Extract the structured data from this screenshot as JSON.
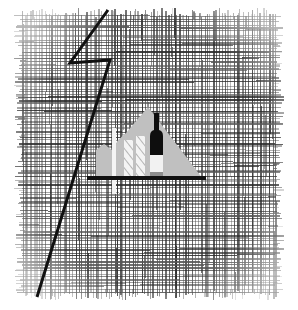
{
  "artwork": {
    "title": "Crosshatched Square with Mountain, Candles, Bottle and Lightning Bolt",
    "medium": "pen-and-ink line drawing",
    "canvas": {
      "width": 298,
      "height": 310,
      "background_color": "#ffffff"
    },
    "palette": {
      "ink": "#111111",
      "hatch_dark": "#2b2b2b",
      "hatch_mid": "#555555",
      "silhouette_gray": "#c0c0c0",
      "highlight_white": "#f4f4f4",
      "bottle_dark": "#0e0e0e",
      "bottle_light": "#f2f2f2",
      "background": "#ffffff"
    },
    "elements": [
      {
        "name": "crosshatch-field",
        "label": "Crosshatched square background",
        "shape": "square",
        "x": 22,
        "y": 16,
        "width": 254,
        "height": 276,
        "edge": "frayed",
        "vertical_strokes": 86,
        "horizontal_strokes": 92,
        "color": "#2b2b2b"
      },
      {
        "name": "mountain-silhouette",
        "label": "Gray mountain / house silhouette",
        "shape": "polygon",
        "apex": [
          148,
          107
        ],
        "base_y": 179,
        "left_edge_x": 96,
        "right_edge_x": 203,
        "fill": "#c0c0c0",
        "has_left_shoulder_notch": true
      },
      {
        "name": "ground-bar",
        "label": "Horizontal black ground bar",
        "shape": "rect",
        "x": 87,
        "y": 176,
        "width": 119,
        "height": 4,
        "fill": "#111111"
      },
      {
        "name": "light-pole",
        "label": "Tall thin light vertical bar",
        "shape": "rect",
        "x": 112,
        "y": 128,
        "width": 4,
        "height": 66,
        "fill": "#f4f4f4"
      },
      {
        "name": "candle-left",
        "label": "Left hatched candle bar",
        "shape": "rect",
        "x": 124,
        "y": 140,
        "width": 9,
        "height": 38,
        "fill": "#f4f4f4",
        "hatching": "diagonal"
      },
      {
        "name": "candle-right",
        "label": "Right hatched candle bar",
        "shape": "rect",
        "x": 136,
        "y": 136,
        "width": 9,
        "height": 42,
        "fill": "#f4f4f4",
        "hatching": "diagonal"
      },
      {
        "name": "bottle",
        "label": "Dark bottle with light base",
        "neck": {
          "x": 154,
          "y": 114,
          "width": 5,
          "height": 17
        },
        "body": {
          "x": 150,
          "y": 131,
          "width": 13,
          "height": 24
        },
        "base": {
          "x": 150,
          "y": 155,
          "width": 13,
          "height": 24
        },
        "neck_fill": "#0e0e0e",
        "body_fill": "#0e0e0e",
        "base_fill": "#f2f2f2"
      },
      {
        "name": "lightning-bolt",
        "label": "Lightning bolt zigzag line",
        "shape": "polyline",
        "points": [
          [
            108,
            10
          ],
          [
            70,
            63
          ],
          [
            110,
            60
          ],
          [
            37,
            297
          ]
        ],
        "stroke": "#111111",
        "stroke_width": 3
      }
    ]
  }
}
